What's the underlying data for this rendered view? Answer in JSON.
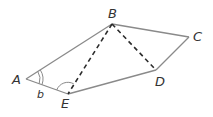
{
  "diagram": {
    "type": "geometry",
    "colors": {
      "solid_line": "#8a8a8a",
      "dashed_line": "#2b2b2b",
      "label": "#333333",
      "arc": "#8a8a8a"
    },
    "points": {
      "A": {
        "label": "A",
        "x": 26,
        "y": 79
      },
      "B": {
        "label": "B",
        "x": 112,
        "y": 24
      },
      "C": {
        "label": "C",
        "x": 189,
        "y": 37
      },
      "D": {
        "label": "D",
        "x": 156,
        "y": 70
      },
      "E": {
        "label": "E",
        "x": 68,
        "y": 94
      }
    },
    "solid_edges": [
      "AB",
      "BC",
      "CD",
      "DE",
      "EA"
    ],
    "dashed_edges": [
      "BE",
      "BD"
    ],
    "angle_labels": {
      "at_A": "b"
    }
  }
}
